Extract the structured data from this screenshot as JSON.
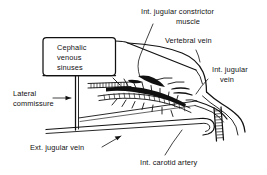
{
  "figure": {
    "type": "anatomical-line-drawing",
    "background_color": "#ffffff",
    "ink_color": "#111111",
    "labels": [
      {
        "id": "int-jugular-constrictor-muscle",
        "text_line_1": "Int. jugular constrictor",
        "text_line_2": "muscle",
        "position": "top-center",
        "has_leader_line": true
      },
      {
        "id": "vertebral-vein",
        "text_line_1": "Vertebral vein",
        "position": "top-right",
        "has_leader_line": true
      },
      {
        "id": "int-jugular-vein",
        "text_line_1": "Int. jugular",
        "text_line_2": "vein",
        "position": "right",
        "has_leader_line": true
      },
      {
        "id": "cephalic-venous-sinuses",
        "text_line_1": "Cephalic",
        "text_line_2": "venous",
        "text_line_3": "sinuses",
        "position": "left-box",
        "has_leader_line": false
      },
      {
        "id": "lateral-commissure",
        "text_line_1": "Lateral",
        "text_line_2": "commissure",
        "position": "left",
        "has_leader_line": true,
        "leader_style": "arrow"
      },
      {
        "id": "ext-jugular-vein",
        "text_line_1": "Ext. jugular vein",
        "position": "bottom-left",
        "has_leader_line": true,
        "leader_style": "arrow"
      },
      {
        "id": "int-carotid-artery",
        "text_line_1": "Int. carotid artery",
        "position": "bottom-right",
        "has_leader_line": true
      }
    ]
  }
}
